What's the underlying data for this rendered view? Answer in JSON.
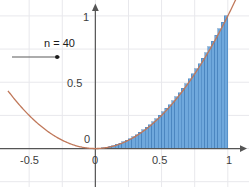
{
  "app": {
    "title": "Riemann Sum Visualization",
    "background_color": "#ffffff"
  },
  "slider": {
    "name": "n",
    "label": "n = 40",
    "value": 40,
    "handle_position_fraction": 0.94,
    "track_color": "#5a5a5a",
    "handle_color": "#1a1a1a"
  },
  "axes": {
    "axis_color": "#555555",
    "grid_color": "#e8e8ec",
    "x_labels": [
      "-0.5",
      "0",
      "0.5",
      "1"
    ],
    "y_labels": [
      "1",
      "0.5",
      "0"
    ],
    "origin_label": "0",
    "x_range": [
      -0.72,
      1.16
    ],
    "y_range": [
      -0.29,
      1.12
    ],
    "grid_step": 0.25
  },
  "chart_data": {
    "type": "area",
    "title": "",
    "xlabel": "",
    "ylabel": "",
    "xlim": [
      -0.72,
      1.16
    ],
    "ylim": [
      -0.29,
      1.12
    ],
    "grid": true,
    "legend": "none",
    "curve": {
      "name": "f(x) = x^2",
      "color": "#c0785a",
      "x_start": -0.66,
      "x_end": 1.06,
      "points_x": [
        -0.66,
        -0.6,
        -0.5,
        -0.4,
        -0.3,
        -0.2,
        -0.1,
        0.0,
        0.1,
        0.2,
        0.3,
        0.4,
        0.5,
        0.6,
        0.7,
        0.8,
        0.9,
        1.0,
        1.06
      ],
      "points_y": [
        0.4356,
        0.36,
        0.25,
        0.16,
        0.09,
        0.04,
        0.01,
        0.0,
        0.01,
        0.04,
        0.09,
        0.16,
        0.25,
        0.36,
        0.49,
        0.64,
        0.81,
        1.0,
        1.1236
      ]
    },
    "riemann": {
      "n": 40,
      "a": 0,
      "b": 1,
      "rule": "right-endpoint",
      "fill_color": "#6fa8dc",
      "edge_color": "#3c78b4",
      "bar_heights": [
        0.000625,
        0.0025,
        0.005625,
        0.01,
        0.015625,
        0.0225,
        0.030625,
        0.04,
        0.050625,
        0.0625,
        0.075625,
        0.09,
        0.105625,
        0.1225,
        0.140625,
        0.16,
        0.180625,
        0.2025,
        0.225625,
        0.25,
        0.275625,
        0.3025,
        0.330625,
        0.36,
        0.390625,
        0.4225,
        0.455625,
        0.49,
        0.525625,
        0.5625,
        0.600625,
        0.64,
        0.680625,
        0.7225,
        0.765625,
        0.81,
        0.855625,
        0.9025,
        0.950625,
        1.0
      ]
    }
  }
}
